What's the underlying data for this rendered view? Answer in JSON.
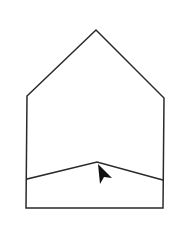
{
  "diagram": {
    "type": "house-outline",
    "colors": {
      "background": "#ffffff",
      "stroke": "#2a2a2a",
      "cursor": "#111111"
    },
    "outline_points": "27,96 96,30 164,98 163,208 26,208",
    "divider_points": "27,179 97,162 163,180",
    "cursor": {
      "icon": "mouse-pointer-arrow",
      "points": "98,164 112,178 104,177 100,184"
    }
  }
}
